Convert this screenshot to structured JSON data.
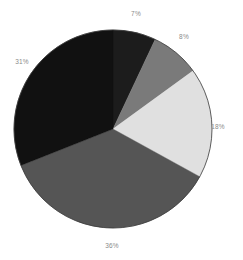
{
  "chart_data": {
    "type": "pie",
    "title": "",
    "xlabel": "",
    "ylabel": "",
    "grid": false,
    "legend": "none",
    "label_format": "percent",
    "start_angle_deg": 0,
    "direction": "clockwise",
    "background": "#ffffff",
    "outline_color": "#3a3a3a",
    "categories": [
      "7%",
      "8%",
      "18%",
      "36%",
      "31%"
    ],
    "values": [
      7,
      8,
      18,
      36,
      31
    ],
    "labels": [
      "7%",
      "8%",
      "18%",
      "36%",
      "31%"
    ],
    "colors": [
      "#1c1c1c",
      "#7a7a7a",
      "#e0e0e0",
      "#555555",
      "#111111"
    ],
    "total": 100,
    "slices": [
      {
        "label": "7%",
        "value": 7,
        "color": "#1c1c1c",
        "label_x": 136,
        "label_y": 14
      },
      {
        "label": "8%",
        "value": 8,
        "color": "#7a7a7a",
        "label_x": 184,
        "label_y": 37
      },
      {
        "label": "18%",
        "value": 18,
        "color": "#e0e0e0",
        "label_x": 218,
        "label_y": 127
      },
      {
        "label": "36%",
        "value": 36,
        "color": "#555555",
        "label_x": 112,
        "label_y": 246
      },
      {
        "label": "31%",
        "value": 31,
        "color": "#111111",
        "label_x": 22,
        "label_y": 62
      }
    ],
    "geometry": {
      "center_x": 113,
      "center_y": 129,
      "radius": 99
    }
  }
}
